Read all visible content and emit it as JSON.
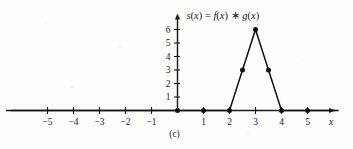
{
  "figure": {
    "caption": "(c)",
    "title_parts": {
      "s": "s",
      "lp1": "(",
      "x1": "x",
      "rp1": ")",
      "eq": " = ",
      "f": "f",
      "lp2": "(",
      "x2": "x",
      "rp2": ")",
      "conv": " ∗ ",
      "g": "g",
      "lp3": "(",
      "x3": "x",
      "rp3": ")"
    },
    "title_plain": "s(x) = f(x) ∗ g(x)",
    "x_axis_name": "x"
  },
  "chart_data": {
    "type": "line",
    "title": "s(x) = f(x) ∗ g(x)",
    "xlabel": "x",
    "ylabel": "",
    "xlim": [
      -6.4,
      6.4
    ],
    "ylim": [
      0,
      6.6
    ],
    "grid": false,
    "legend": null,
    "x_ticks": [
      -5,
      -4,
      -3,
      -2,
      -1,
      1,
      2,
      3,
      4,
      5
    ],
    "x_tick_labels": [
      "-5",
      "-4",
      "-3",
      "-2",
      "-1",
      "1",
      "2",
      "3",
      "4",
      "5"
    ],
    "y_ticks": [
      1,
      2,
      3,
      4,
      5,
      6
    ],
    "y_tick_labels": [
      "1",
      "2",
      "3",
      "4",
      "5",
      "6"
    ],
    "series": [
      {
        "name": "s(x) = f(x) ∗ g(x)",
        "x": [
          -6.4,
          2,
          2.5,
          3,
          3.5,
          4,
          6.2
        ],
        "y": [
          0,
          0,
          3,
          6,
          3,
          0,
          0
        ]
      }
    ],
    "markers": [
      {
        "x": 0,
        "y": 0
      },
      {
        "x": 1,
        "y": 0
      },
      {
        "x": 2,
        "y": 0
      },
      {
        "x": 2.5,
        "y": 3
      },
      {
        "x": 3,
        "y": 6
      },
      {
        "x": 3.5,
        "y": 3
      },
      {
        "x": 4,
        "y": 0
      },
      {
        "x": 5,
        "y": 0
      }
    ]
  }
}
